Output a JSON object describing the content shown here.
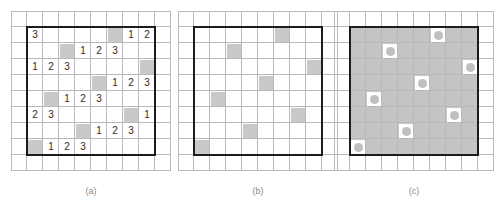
{
  "figure": {
    "grid": {
      "cols": 10,
      "rows": 10,
      "cell_size": 16,
      "inner_box": {
        "col_start": 1,
        "row_start": 1,
        "cols": 8,
        "rows": 8
      }
    },
    "colors": {
      "shade": "#c9c9c9",
      "interior_fill": "#c4c4c4",
      "dot": "#c0c0c0",
      "gridline": "#b9b9b9",
      "thick_border": "#1c1c1c",
      "numeral": "#2a2a2a",
      "caption": "#8a8a8a",
      "background": "#ffffff"
    }
  },
  "panels": [
    {
      "id": "panel-a",
      "caption": "(a)",
      "left": 11,
      "mode": "numbers",
      "shaded_cells": [
        {
          "col": 6,
          "row": 1
        },
        {
          "col": 3,
          "row": 2
        },
        {
          "col": 8,
          "row": 3
        },
        {
          "col": 5,
          "row": 4
        },
        {
          "col": 2,
          "row": 5
        },
        {
          "col": 7,
          "row": 6
        },
        {
          "col": 4,
          "row": 7
        },
        {
          "col": 1,
          "row": 8
        }
      ],
      "numbers": [
        {
          "col": 1,
          "row": 1,
          "value": "3"
        },
        {
          "col": 7,
          "row": 1,
          "value": "1"
        },
        {
          "col": 8,
          "row": 1,
          "value": "2"
        },
        {
          "col": 4,
          "row": 2,
          "value": "1"
        },
        {
          "col": 5,
          "row": 2,
          "value": "2"
        },
        {
          "col": 6,
          "row": 2,
          "value": "3"
        },
        {
          "col": 1,
          "row": 3,
          "value": "1"
        },
        {
          "col": 2,
          "row": 3,
          "value": "2"
        },
        {
          "col": 3,
          "row": 3,
          "value": "3"
        },
        {
          "col": 6,
          "row": 4,
          "value": "1"
        },
        {
          "col": 7,
          "row": 4,
          "value": "2"
        },
        {
          "col": 8,
          "row": 4,
          "value": "3"
        },
        {
          "col": 3,
          "row": 5,
          "value": "1"
        },
        {
          "col": 4,
          "row": 5,
          "value": "2"
        },
        {
          "col": 5,
          "row": 5,
          "value": "3"
        },
        {
          "col": 1,
          "row": 6,
          "value": "2"
        },
        {
          "col": 2,
          "row": 6,
          "value": "3"
        },
        {
          "col": 8,
          "row": 6,
          "value": "1"
        },
        {
          "col": 5,
          "row": 7,
          "value": "1"
        },
        {
          "col": 6,
          "row": 7,
          "value": "2"
        },
        {
          "col": 7,
          "row": 7,
          "value": "3"
        },
        {
          "col": 2,
          "row": 8,
          "value": "1"
        },
        {
          "col": 3,
          "row": 8,
          "value": "2"
        },
        {
          "col": 4,
          "row": 8,
          "value": "3"
        }
      ]
    },
    {
      "id": "panel-b",
      "caption": "(b)",
      "left": 178,
      "mode": "shaded-only",
      "shaded_cells": [
        {
          "col": 6,
          "row": 1
        },
        {
          "col": 3,
          "row": 2
        },
        {
          "col": 8,
          "row": 3
        },
        {
          "col": 5,
          "row": 4
        },
        {
          "col": 2,
          "row": 5
        },
        {
          "col": 7,
          "row": 6
        },
        {
          "col": 4,
          "row": 7
        },
        {
          "col": 1,
          "row": 8
        }
      ],
      "numbers": []
    },
    {
      "id": "panel-c",
      "caption": "(c)",
      "left": 334,
      "mode": "inverted-dots",
      "shaded_cells": [
        {
          "col": 6,
          "row": 1
        },
        {
          "col": 3,
          "row": 2
        },
        {
          "col": 8,
          "row": 3
        },
        {
          "col": 5,
          "row": 4
        },
        {
          "col": 2,
          "row": 5
        },
        {
          "col": 7,
          "row": 6
        },
        {
          "col": 4,
          "row": 7
        },
        {
          "col": 1,
          "row": 8
        }
      ],
      "numbers": []
    }
  ]
}
